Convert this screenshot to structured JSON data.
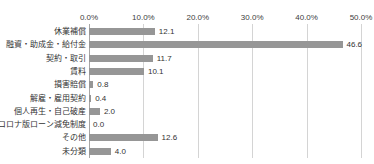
{
  "chart_data": {
    "type": "bar",
    "orientation": "horizontal",
    "title": "",
    "subtitle": "",
    "xlabel": "",
    "ylabel": "",
    "xlim": [
      0,
      50
    ],
    "xticks": [
      0,
      10,
      20,
      30,
      40,
      50
    ],
    "xtick_labels": [
      "0.0%",
      "10.0%",
      "20.0%",
      "30.0%",
      "40.0%",
      "50.0%"
    ],
    "grid": true,
    "legend": false,
    "bar_color": "#969696",
    "gridline_color": "#d4d4d4",
    "axis_color": "#a6a6a6",
    "categories": [
      "休業補償",
      "融資・助成金・給付金",
      "契約・取引",
      "賃料",
      "損害賠償",
      "解雇・雇用契約",
      "個人再生・自己破産",
      "コロナ版ローン減免制度",
      "その他",
      "未分類"
    ],
    "values": [
      12.1,
      46.6,
      11.7,
      10.1,
      0.8,
      0.4,
      2.0,
      0.0,
      12.6,
      4.0
    ],
    "value_labels": [
      "12.1",
      "46.6",
      "11.7",
      "10.1",
      "0.8",
      "0.4",
      "2.0",
      "0.0",
      "12.6",
      "4.0"
    ]
  },
  "cut_off_header": {
    "fragments": [
      "",
      ""
    ]
  }
}
